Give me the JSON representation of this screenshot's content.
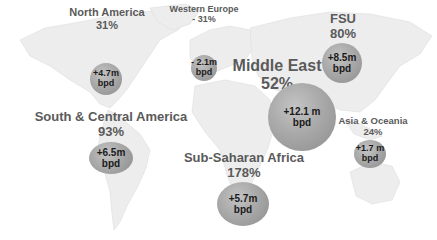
{
  "map": {
    "type": "world-bubble-map",
    "unit": "bpd",
    "colors": {
      "land": "#ededed",
      "land_border": "#d9d9d9",
      "label_text": "#5a5a5a",
      "bubble_fill": "#a9a9a9",
      "bubble_text": "#1a1a1a"
    },
    "regions": [
      {
        "id": "north-america",
        "name": "North America",
        "percent": "31%",
        "change": "+4.7m",
        "unit": "bpd"
      },
      {
        "id": "western-europe",
        "name": "Western Europe",
        "percent": "- 31%",
        "change": "- 2.1m",
        "unit": "bpd"
      },
      {
        "id": "middle-east",
        "name": "Middle East",
        "percent": "52%",
        "change": "+12.1 m",
        "unit": "bpd"
      },
      {
        "id": "fsu",
        "name": "FSU",
        "percent": "80%",
        "change": "+8.5m",
        "unit": "bpd"
      },
      {
        "id": "south-central-america",
        "name": "South & Central America",
        "percent": "93%",
        "change": "+6.5m",
        "unit": "bpd"
      },
      {
        "id": "sub-saharan-africa",
        "name": "Sub-Saharan Africa",
        "percent": "178%",
        "change": "+5.7m",
        "unit": "bpd"
      },
      {
        "id": "asia-oceania",
        "name": "Asia & Oceania",
        "percent": "24%",
        "change": "+1.7 m",
        "unit": "bpd"
      }
    ]
  }
}
